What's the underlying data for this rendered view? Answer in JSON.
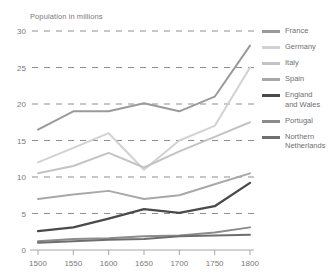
{
  "chart_data": {
    "type": "line",
    "title": "Population in millions",
    "xlabel": "",
    "ylabel": "Population in millions",
    "x": [
      1500,
      1550,
      1600,
      1650,
      1700,
      1750,
      1800
    ],
    "xtick_labels": [
      "1500",
      "1550",
      "1600",
      "1650",
      "1700",
      "1750",
      "1800"
    ],
    "ytick_labels": [
      "0",
      "5",
      "10",
      "15",
      "20",
      "25",
      "30"
    ],
    "yticks": [
      0,
      5,
      10,
      15,
      20,
      25,
      30
    ],
    "xlim": [
      1500,
      1800
    ],
    "ylim": [
      0,
      30
    ],
    "grid": "horizontal-dashed",
    "legend_position": "right",
    "series": [
      {
        "name": "France",
        "label": "France",
        "color": "#9a9a9a",
        "width": 2.0,
        "values": [
          16.5,
          19.0,
          19.0,
          20.1,
          19.0,
          21.0,
          28.0
        ]
      },
      {
        "name": "Germany",
        "label": "Germany",
        "color": "#d2d2d2",
        "width": 2.0,
        "values": [
          12.0,
          14.0,
          16.0,
          11.0,
          15.0,
          17.0,
          25.0
        ]
      },
      {
        "name": "Italy",
        "label": "Italy",
        "color": "#c3c3c3",
        "width": 2.0,
        "values": [
          10.5,
          11.5,
          13.3,
          11.3,
          13.5,
          15.5,
          17.5
        ]
      },
      {
        "name": "Spain",
        "label": "Spain",
        "color": "#a8a8a8",
        "width": 2.0,
        "values": [
          7.0,
          7.6,
          8.1,
          7.0,
          7.5,
          9.0,
          10.5
        ]
      },
      {
        "name": "England and Wales",
        "label": "England\nand Wales",
        "color": "#4a4a4a",
        "width": 2.3,
        "values": [
          2.6,
          3.1,
          4.3,
          5.6,
          5.1,
          6.0,
          9.2
        ]
      },
      {
        "name": "Portugal",
        "label": "Portugal",
        "color": "#8c8c8c",
        "width": 2.0,
        "values": [
          1.2,
          1.5,
          1.6,
          1.9,
          2.0,
          2.4,
          3.1
        ]
      },
      {
        "name": "Northern Netherlands",
        "label": "Northern\nNetherlands",
        "color": "#6e6e6e",
        "width": 2.0,
        "values": [
          1.0,
          1.2,
          1.4,
          1.5,
          1.9,
          2.0,
          2.1
        ]
      }
    ]
  }
}
